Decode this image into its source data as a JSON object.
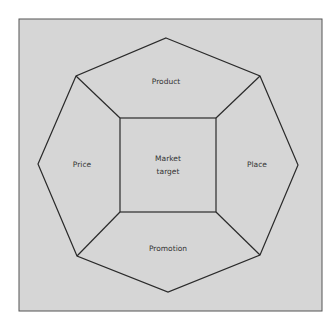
{
  "diagram": {
    "title": "",
    "center": {
      "line1": "Market",
      "line2": "target"
    },
    "segments": {
      "top": "Product",
      "left": "Price",
      "right": "Place",
      "bottom": "Promotion"
    },
    "colors": {
      "background": "#d6d6d6",
      "stroke": "#2a2a2a",
      "frame": "#555555"
    }
  }
}
